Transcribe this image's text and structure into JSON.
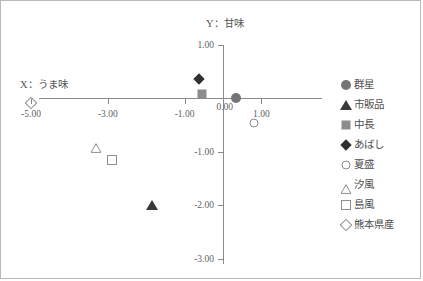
{
  "chart_data": {
    "type": "scatter",
    "title": "",
    "xlabel": "X：うま味",
    "ylabel": "Y：甘味",
    "xlim": [
      -5.6,
      1.75
    ],
    "ylim": [
      -3.0,
      1.0
    ],
    "grid": false,
    "legend_position": "right",
    "x_ticks": [
      {
        "value": -5.0,
        "label": "-5.00"
      },
      {
        "value": -3.0,
        "label": "-3.00"
      },
      {
        "value": -1.0,
        "label": "-1.00"
      },
      {
        "value": 1.0,
        "label": "1.00"
      }
    ],
    "y_ticks": [
      {
        "value": 1.0,
        "label": "1.00"
      },
      {
        "value": 0.0,
        "label": "0.00"
      },
      {
        "value": -1.0,
        "label": "-1.00"
      },
      {
        "value": -2.0,
        "label": "-2.00"
      },
      {
        "value": -3.0,
        "label": "-3.00"
      }
    ],
    "series": [
      {
        "name": "群星",
        "marker": "circle-filled",
        "color": "#757575",
        "x": 0.35,
        "y": 0.0
      },
      {
        "name": "市販品",
        "marker": "triangle-filled",
        "color": "#3a3a3a",
        "x": -1.85,
        "y": -2.0
      },
      {
        "name": "中長",
        "marker": "square-filled",
        "color": "#8c8c8c",
        "x": -0.55,
        "y": 0.07
      },
      {
        "name": "あばし",
        "marker": "diamond-filled",
        "color": "#2f2f2f",
        "x": -0.62,
        "y": 0.36
      },
      {
        "name": "夏盛",
        "marker": "circle-open",
        "color": "#8d8d8d",
        "x": 0.82,
        "y": -0.46
      },
      {
        "name": "汐風",
        "marker": "triangle-open",
        "color": "#8d8d8d",
        "x": -3.3,
        "y": -0.86
      },
      {
        "name": "島風",
        "marker": "square-open",
        "color": "#8d8d8d",
        "x": -2.9,
        "y": -1.16
      },
      {
        "name": "熊本県産",
        "marker": "diamond-open",
        "color": "#8d8d8d",
        "x": -5.0,
        "y": -0.1
      }
    ]
  }
}
